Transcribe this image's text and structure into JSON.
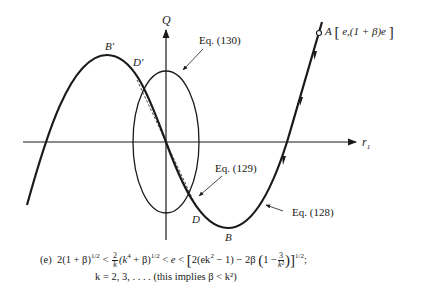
{
  "axes": {
    "y_label": "Q",
    "x_label": "r",
    "x_label_sub": "1"
  },
  "points": {
    "A": {
      "name": "A",
      "coords": "e,(1 + β)e"
    },
    "B": "B",
    "B_prime": "B′",
    "D": "D",
    "D_prime": "D′"
  },
  "curve_labels": {
    "eq128": "Eq. (128)",
    "eq129": "Eq. (129)",
    "eq130": "Eq. (130)"
  },
  "caption": {
    "tag": "(e)",
    "line1_part1": "2(1 + β)",
    "exp_half": "1/2",
    "lt": "<",
    "frac_num": "2",
    "frac_den": "k",
    "paren_k4": "(k",
    "four": "4",
    "plus_beta": " + β)",
    "e": "e",
    "bracket_open": "[",
    "inner1": "2(ek",
    "two": "2",
    "inner2": " − 1) − 2β",
    "paren_open": "(",
    "one_minus": "1 −",
    "frac3_num": "3",
    "frac3_den": "k²",
    "paren_close": ")",
    "bracket_close": "]",
    "semicolon": ";",
    "line2": "k = 2, 3, . . . . (this implies β < k²)"
  },
  "colors": {
    "ink": "#1a1a1a",
    "background": "#ffffff"
  }
}
